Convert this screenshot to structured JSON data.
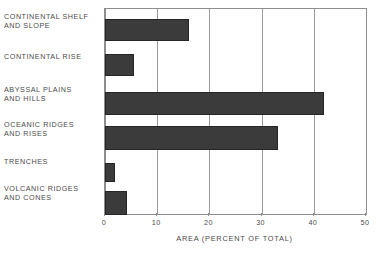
{
  "chart_data": {
    "type": "bar",
    "orientation": "horizontal",
    "title": "",
    "subtitle": "",
    "xlabel": "AREA (PERCENT OF TOTAL)",
    "ylabel": "",
    "xlim": [
      0,
      50
    ],
    "xticks": [
      0,
      10,
      20,
      30,
      40,
      50
    ],
    "xtick_labels": [
      "0",
      "10",
      "20",
      "30",
      "40",
      "50"
    ],
    "grid": true,
    "grid_axis": "x",
    "legend": false,
    "legend_position": "none",
    "bar_color": "#3b3b3b",
    "axis_color": "#8e8e8e",
    "text_color": "#4b4b4b",
    "categories": [
      "CONTINENTAL SHELF\nAND SLOPE",
      "CONTINENTAL RISE",
      "ABYSSAL PLAINS\nAND HILLS",
      "OCEANIC RIDGES\nAND RISES",
      "TRENCHES",
      "VOLCANIC RIDGES\nAND CONES"
    ],
    "values": [
      16.0,
      5.6,
      41.9,
      33.2,
      1.9,
      4.2
    ]
  },
  "bar_geometry": [
    {
      "top": 10,
      "height": 22
    },
    {
      "top": 45,
      "height": 22
    },
    {
      "top": 83,
      "height": 23
    },
    {
      "top": 117,
      "height": 24
    },
    {
      "top": 154,
      "height": 19
    },
    {
      "top": 182,
      "height": 24
    }
  ],
  "label_geometry": [
    {
      "top": 12
    },
    {
      "top": 52
    },
    {
      "top": 85
    },
    {
      "top": 120
    },
    {
      "top": 157
    },
    {
      "top": 184
    }
  ]
}
